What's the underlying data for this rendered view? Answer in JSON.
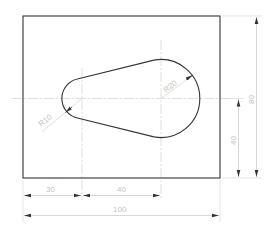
{
  "drawing": {
    "type": "technical-drawing",
    "description": "Rectangular plate with keyhole/teardrop-shaped slot",
    "colors": {
      "outline": "#333333",
      "centerline": "#d8d8d8",
      "dimension": "#c8c8c8",
      "dimension_text": "#c4c4c4",
      "arrow": "#333333"
    },
    "plate": {
      "width": 100,
      "height": 80
    },
    "small_arc": {
      "radius_label": "R10",
      "radius": 10,
      "center_x_from_left": 30,
      "center_y_from_bottom": 40
    },
    "large_arc": {
      "radius_label": "R20",
      "radius": 20,
      "center_offset_from_small": 40
    },
    "dimensions": {
      "horizontal_left_offset": "30",
      "horizontal_center_distance": "40",
      "horizontal_overall_width": "100",
      "vertical_center_height": "40",
      "vertical_overall_height": "80"
    }
  }
}
